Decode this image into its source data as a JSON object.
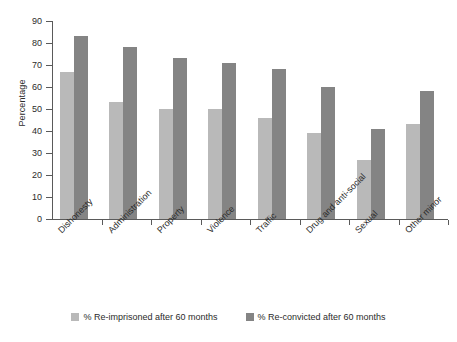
{
  "chart_data": {
    "type": "bar",
    "title": "",
    "xlabel": "",
    "ylabel": "Percentage",
    "ylim": [
      0,
      90
    ],
    "yticks": [
      0,
      10,
      20,
      30,
      40,
      50,
      60,
      70,
      80,
      90
    ],
    "grid": false,
    "legend_position": "bottom",
    "categories": [
      "Dishonesty",
      "Administration",
      "Property",
      "Violence",
      "Traffic",
      "Drug and anti-social",
      "Sexual",
      "Other minor"
    ],
    "series": [
      {
        "name": "% Re-imprisoned after 60 months",
        "color": "#b9b9b9",
        "values": [
          67,
          53,
          50,
          50,
          46,
          39,
          27,
          43
        ]
      },
      {
        "name": "% Re-convicted after 60 months",
        "color": "#848484",
        "values": [
          83,
          78,
          73,
          71,
          68,
          60,
          41,
          58
        ]
      }
    ]
  },
  "axis": {
    "y_title": "Percentage"
  },
  "colors": {
    "series_light": "#b9b9b9",
    "series_dark": "#848484",
    "axis": "#5a5a5a",
    "text": "#2b2b2b",
    "background": "#ffffff"
  }
}
